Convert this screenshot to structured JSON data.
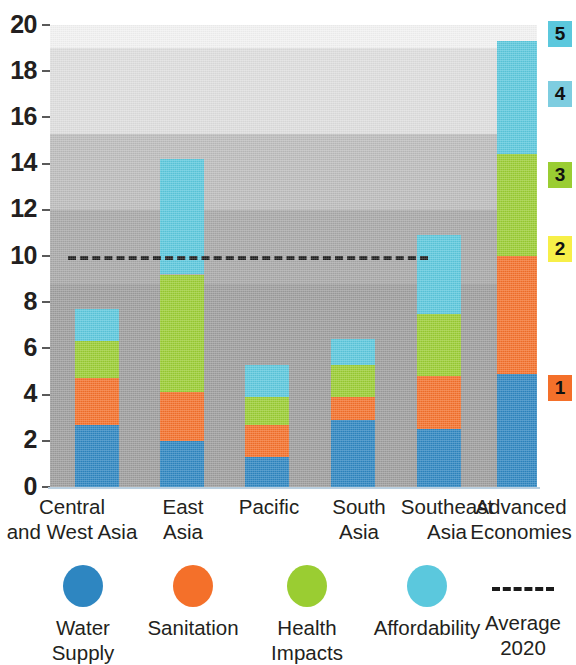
{
  "chart_data": {
    "type": "bar",
    "stacked": true,
    "title": "",
    "xlabel": "",
    "ylabel": "",
    "ylim": [
      0,
      20
    ],
    "ytick_values": [
      0,
      2,
      4,
      6,
      8,
      10,
      12,
      14,
      16,
      18,
      20
    ],
    "ytick_labels": [
      "0",
      "2",
      "4",
      "6",
      "8",
      "10",
      "12",
      "14",
      "16",
      "18",
      "20"
    ],
    "grid": false,
    "legend_position": "bottom",
    "categories": [
      "Central\nand West Asia",
      "East\nAsia",
      "Pacific",
      "South\nAsia",
      "Southeast\nAsia",
      "Advanced\nEconomies"
    ],
    "series": [
      {
        "name": "Water Supply",
        "color": "#2e86c1",
        "values": [
          2.7,
          2.0,
          1.3,
          2.9,
          2.5,
          4.9
        ]
      },
      {
        "name": "Sanitation",
        "color": "#f4702a",
        "values": [
          2.0,
          2.1,
          1.4,
          1.0,
          2.3,
          5.1
        ]
      },
      {
        "name": "Health Impacts",
        "color": "#9acd32",
        "values": [
          1.6,
          5.1,
          1.2,
          1.4,
          2.7,
          4.4
        ]
      },
      {
        "name": "Affordability",
        "color": "#5bc8dd",
        "values": [
          1.4,
          5.0,
          1.4,
          1.1,
          3.4,
          4.9
        ]
      }
    ],
    "totals": [
      7.7,
      14.2,
      5.3,
      6.4,
      10.9,
      19.3
    ],
    "reference_line": {
      "label": "Average 2020",
      "value": 10,
      "style": "dashed",
      "color": "#1b1b1b"
    },
    "background_bands": [
      {
        "from": 0.0,
        "to": 8.8,
        "color": "#9d9d9d",
        "label_index": 1
      },
      {
        "from": 8.8,
        "to": 12.0,
        "color": "#a8a8a8",
        "label_index": 2
      },
      {
        "from": 12.0,
        "to": 15.3,
        "color": "#bcbcbc",
        "label_index": 3
      },
      {
        "from": 15.3,
        "to": 19.0,
        "color": "#dedede",
        "label_index": 4
      },
      {
        "from": 19.0,
        "to": 20.0,
        "color": "#f2f2f2",
        "label_index": 5
      }
    ]
  },
  "side_markers": [
    {
      "label": "5",
      "color": "#5bc8dd",
      "value": 19.6
    },
    {
      "label": "4",
      "color": "#7ecde0",
      "value": 17.0
    },
    {
      "label": "3",
      "color": "#9acd32",
      "value": 13.5
    },
    {
      "label": "2",
      "color": "#f7ef48",
      "value": 10.3
    },
    {
      "label": "1",
      "color": "#f4702a",
      "value": 4.3
    }
  ],
  "legend": {
    "items": [
      {
        "name": "Water Supply",
        "label": "Water\nSupply",
        "color": "#2e86c1",
        "marker": "dot"
      },
      {
        "name": "Sanitation",
        "label": "Sanitation",
        "color": "#f4702a",
        "marker": "dot"
      },
      {
        "name": "Health Impacts",
        "label": "Health\nImpacts",
        "color": "#9acd32",
        "marker": "dot"
      },
      {
        "name": "Affordability",
        "label": "Affordability",
        "color": "#5bc8dd",
        "marker": "dot"
      },
      {
        "name": "Average 2020",
        "label": "Average 2020",
        "color": "#1b1b1b",
        "marker": "dash"
      }
    ]
  },
  "axis": {
    "y_ticks": [
      "20",
      "18",
      "16",
      "14",
      "12",
      "10",
      "8",
      "6",
      "4",
      "2",
      "0"
    ],
    "x_labels": [
      "Central\nand West Asia",
      "East\nAsia",
      "Pacific",
      "South\nAsia",
      "Southeast\nAsia",
      "Advanced\nEconomies"
    ]
  }
}
